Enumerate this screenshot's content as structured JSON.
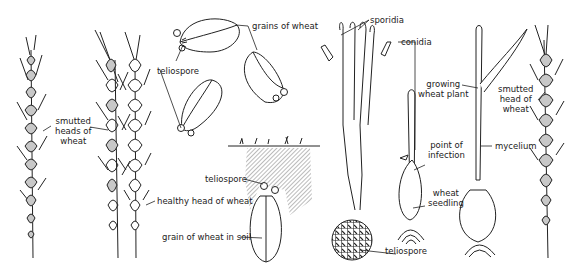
{
  "diagram": {
    "colors": {
      "ink": "#222222",
      "smut_fill": "#c8c8c8",
      "background": "#ffffff",
      "soil_hatch": "#555555"
    },
    "labels": {
      "smutted_heads": [
        "smutted",
        "heads of",
        "wheat"
      ],
      "healthy_head": "healthy head of wheat",
      "teliospore_top": "teliospore",
      "grains_of_wheat": "grains of wheat",
      "teliospore_soil": "teliospore",
      "grain_in_soil": "grain of wheat in soil",
      "sporidia": "sporidia",
      "conidia": "conidia",
      "point_of_infection": [
        "point of",
        "infection"
      ],
      "wheat_seedling": [
        "wheat",
        "seedling"
      ],
      "teliospore_germ": "teliospore",
      "growing_plant": [
        "growing",
        "wheat plant"
      ],
      "mycelium": "mycelium",
      "smutted_head": [
        "smutted",
        "head of",
        "wheat"
      ]
    }
  }
}
